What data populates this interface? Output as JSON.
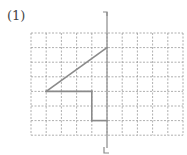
{
  "problem": {
    "label": "(1)"
  },
  "grid": {
    "origin_x": 31,
    "origin_y": 33,
    "cols": 10,
    "rows": 7,
    "cell_w": 15.2,
    "cell_h": 14.6,
    "line_color": "#9a9a9a",
    "dash": "2,1.5"
  },
  "axis_of_symmetry": {
    "column": 5,
    "top_y": 12,
    "bottom_y": 153,
    "color": "#8a8a8a",
    "top_bracket": "left",
    "bottom_bracket": "right"
  },
  "shape": {
    "color": "#8a8a8a",
    "stroke_width": 1.6,
    "segments_grid_coords": [
      [
        [
          1,
          4
        ],
        [
          5,
          1
        ]
      ],
      [
        [
          1,
          4
        ],
        [
          4,
          4
        ]
      ],
      [
        [
          4,
          4
        ],
        [
          4,
          6
        ]
      ],
      [
        [
          4,
          6
        ],
        [
          5,
          6
        ]
      ]
    ]
  }
}
